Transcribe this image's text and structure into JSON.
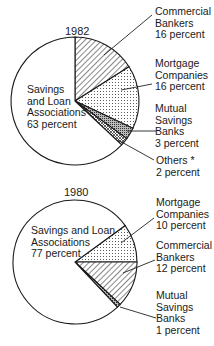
{
  "chart_data": [
    {
      "type": "pie",
      "title": "1982",
      "categories": [
        "Commercial Bankers",
        "Mortgage Companies",
        "Mutual Savings Banks",
        "Others *",
        "Savings and Loan Associations"
      ],
      "values": [
        16,
        16,
        3,
        2,
        63
      ],
      "unit": "percent",
      "start_angle_deg_clockwise_from_top": 0,
      "patterns": [
        "diagonal-hatch",
        "dots",
        "dense-dots",
        "cross-hatch",
        "none"
      ],
      "labels": [
        {
          "text": "Commercial\nBankers\n16 percent",
          "x": 154,
          "y": 10
        },
        {
          "text": "Mortgage\nCompanies\n16 percent",
          "x": 154,
          "y": 58
        },
        {
          "text": "Mutual\nSavings\nBanks\n3 percent",
          "x": 154,
          "y": 102
        },
        {
          "text": "Others *\n2 percent",
          "x": 156,
          "y": 155
        },
        {
          "text": "Savings\nand Loan\nAssociations\n63 percent",
          "x": 26,
          "y": 84
        }
      ]
    },
    {
      "type": "pie",
      "title": "1980",
      "categories": [
        "Mortgage Companies",
        "Commercial Bankers",
        "Mutual Savings Banks",
        "Savings and Loan Associations"
      ],
      "values": [
        10,
        12,
        1,
        77
      ],
      "unit": "percent",
      "start_angle_deg_clockwise_from_top": 54,
      "patterns": [
        "dots",
        "diagonal-hatch",
        "dense-dots",
        "none"
      ],
      "labels": [
        {
          "text": "Mortgage\nCompanies\n10 percent",
          "x": 156,
          "y": 195
        },
        {
          "text": "Commercial\nBankers\n12 percent",
          "x": 156,
          "y": 240
        },
        {
          "text": "Mutual\nSavings\nBanks\n1 percent",
          "x": 156,
          "y": 289
        },
        {
          "text": "Savings and Loan\nAssociations\n77 percent",
          "x": 31,
          "y": 224
        }
      ]
    }
  ],
  "pies": {
    "p1982": {
      "year": "1982",
      "commercial": "Commercial\nBankers\n16 percent",
      "mortgage": "Mortgage\nCompanies\n16 percent",
      "mutual": "Mutual\nSavings\nBanks\n3 percent",
      "others": "Others *\n2 percent",
      "sl": "Savings\nand Loan\nAssociations\n63 percent"
    },
    "p1980": {
      "year": "1980",
      "mortgage": "Mortgage\nCompanies\n10 percent",
      "commercial": "Commercial\nBankers\n12 percent",
      "mutual": "Mutual\nSavings\nBanks\n1 percent",
      "sl": "Savings and Loan\nAssociations\n77 percent"
    }
  }
}
